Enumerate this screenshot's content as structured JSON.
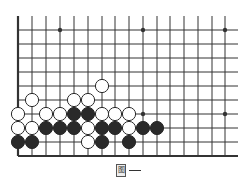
{
  "board": {
    "col_x": [
      18,
      32,
      46,
      60,
      74,
      88,
      102,
      115,
      129,
      143,
      157,
      170,
      184,
      198,
      212,
      225
    ],
    "row_y": [
      30,
      44,
      58,
      72,
      86,
      100,
      114,
      128,
      142,
      156
    ],
    "top_extent": 16,
    "right_extent": 238,
    "left_edge_bold": true,
    "bottom_edge_bold": true,
    "line_color": "#333333",
    "star_points": [
      [
        3,
        0
      ],
      [
        9,
        0
      ],
      [
        15,
        0
      ],
      [
        9,
        6
      ],
      [
        15,
        6
      ]
    ],
    "stones": [
      {
        "c": 6,
        "r": 4,
        "color": "white"
      },
      {
        "c": 1,
        "r": 5,
        "color": "white"
      },
      {
        "c": 4,
        "r": 5,
        "color": "white"
      },
      {
        "c": 5,
        "r": 5,
        "color": "white"
      },
      {
        "c": 0,
        "r": 6,
        "color": "white"
      },
      {
        "c": 2,
        "r": 6,
        "color": "white"
      },
      {
        "c": 3,
        "r": 6,
        "color": "white"
      },
      {
        "c": 4,
        "r": 6,
        "color": "black"
      },
      {
        "c": 5,
        "r": 6,
        "color": "black"
      },
      {
        "c": 6,
        "r": 6,
        "color": "white"
      },
      {
        "c": 7,
        "r": 6,
        "color": "white"
      },
      {
        "c": 8,
        "r": 6,
        "color": "white"
      },
      {
        "c": 0,
        "r": 7,
        "color": "white"
      },
      {
        "c": 1,
        "r": 7,
        "color": "white"
      },
      {
        "c": 2,
        "r": 7,
        "color": "black"
      },
      {
        "c": 3,
        "r": 7,
        "color": "black"
      },
      {
        "c": 4,
        "r": 7,
        "color": "black"
      },
      {
        "c": 5,
        "r": 7,
        "color": "white"
      },
      {
        "c": 6,
        "r": 7,
        "color": "black"
      },
      {
        "c": 7,
        "r": 7,
        "color": "black"
      },
      {
        "c": 8,
        "r": 7,
        "color": "white"
      },
      {
        "c": 9,
        "r": 7,
        "color": "black"
      },
      {
        "c": 10,
        "r": 7,
        "color": "black"
      },
      {
        "c": 0,
        "r": 8,
        "color": "black"
      },
      {
        "c": 1,
        "r": 8,
        "color": "black"
      },
      {
        "c": 5,
        "r": 8,
        "color": "white"
      },
      {
        "c": 6,
        "r": 8,
        "color": "black"
      },
      {
        "c": 8,
        "r": 8,
        "color": "black"
      }
    ],
    "stone_radius": 6.6
  },
  "caption": {
    "label_glyph": "图",
    "dash": "—"
  }
}
